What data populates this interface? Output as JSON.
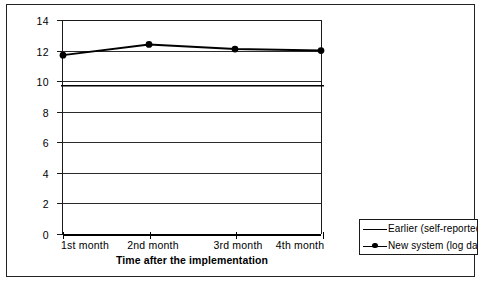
{
  "chart_data": {
    "type": "line",
    "title": "",
    "xlabel": "Time after the implementation",
    "ylabel": "",
    "categories": [
      "1st month",
      "2nd month",
      "3rd month",
      "4th month"
    ],
    "ylim": [
      0,
      14
    ],
    "yticks": [
      0,
      2,
      4,
      6,
      8,
      10,
      12,
      14
    ],
    "ytick_labels": [
      "0",
      "2",
      "4",
      "6",
      "8",
      "10",
      "12",
      "14"
    ],
    "grid": true,
    "grid_axis": "y",
    "legend_position": "outside-bottom-right",
    "series": [
      {
        "name": "Earlier (self-reported)",
        "marker": "none",
        "constant": true,
        "values": [
          9.7,
          9.7,
          9.7,
          9.7
        ],
        "color": "#000000"
      },
      {
        "name": "New system (log data",
        "marker": "circle",
        "values": [
          11.7,
          12.4,
          12.1,
          12.0
        ],
        "color": "#000000"
      }
    ]
  },
  "axis": {
    "x_title": "Time after the implementation",
    "x_labels": [
      "1st month",
      "2nd month",
      "3rd month",
      "4th month"
    ],
    "y_labels": [
      "14",
      "12",
      "10",
      "8",
      "6",
      "4",
      "2",
      "0"
    ]
  },
  "legend": {
    "entries": [
      {
        "label": "Earlier (self-reported)",
        "marker": "line"
      },
      {
        "label": "New system (log data",
        "marker": "line-with-dot"
      }
    ]
  },
  "colors": {
    "series_line": "#000000",
    "grid": "#2b2b2b",
    "axis": "#000000",
    "border": "#222222",
    "background": "#ffffff"
  }
}
